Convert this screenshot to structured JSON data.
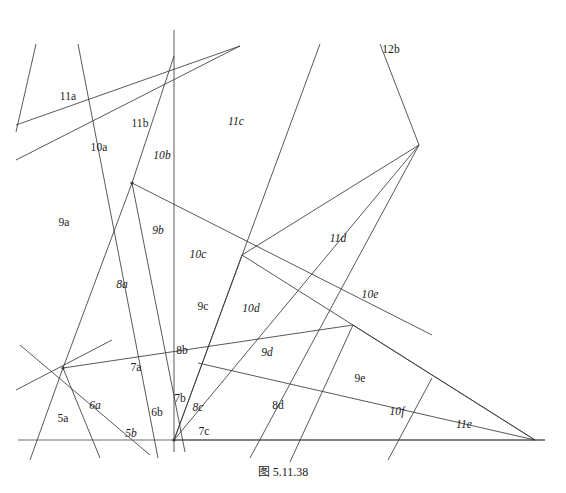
{
  "figure": {
    "caption": "图 5.11.38",
    "width": 566,
    "height": 493,
    "background_color": "#ffffff",
    "line_color": "#3a3a3a",
    "baseline_color": "#6e6e6e",
    "text_color": "#1a1a1a"
  },
  "chart_data": {
    "type": "diagram",
    "title": "图 5.11.38",
    "xlim": [
      0,
      566
    ],
    "ylim": [
      0,
      493
    ],
    "grid": false,
    "legend": null,
    "lines": [
      {
        "id": "L01",
        "x1": 18,
        "y1": 440,
        "x2": 545,
        "y2": 440,
        "role": "baseline"
      },
      {
        "id": "L02",
        "x1": 36,
        "y1": 44,
        "x2": 16,
        "y2": 132,
        "role": "stub"
      },
      {
        "id": "L03",
        "x1": 78,
        "y1": 44,
        "x2": 158,
        "y2": 458,
        "role": "line"
      },
      {
        "id": "L04",
        "x1": 174,
        "y1": 30,
        "x2": 174,
        "y2": 452,
        "role": "vertical"
      },
      {
        "id": "L05",
        "x1": 16,
        "y1": 125,
        "x2": 240,
        "y2": 46,
        "role": "line"
      },
      {
        "id": "L06",
        "x1": 16,
        "y1": 160,
        "x2": 240,
        "y2": 46,
        "role": "line"
      },
      {
        "id": "L07",
        "x1": 132,
        "y1": 183,
        "x2": 174,
        "y2": 56,
        "role": "line"
      },
      {
        "id": "L08",
        "x1": 132,
        "y1": 183,
        "x2": 63,
        "y2": 368,
        "role": "line"
      },
      {
        "id": "L09",
        "x1": 132,
        "y1": 183,
        "x2": 185,
        "y2": 452,
        "role": "line"
      },
      {
        "id": "L10",
        "x1": 132,
        "y1": 183,
        "x2": 432,
        "y2": 335,
        "role": "line"
      },
      {
        "id": "L11",
        "x1": 63,
        "y1": 368,
        "x2": 353,
        "y2": 325,
        "role": "line"
      },
      {
        "id": "L12",
        "x1": 63,
        "y1": 368,
        "x2": 30,
        "y2": 460,
        "role": "line"
      },
      {
        "id": "L13",
        "x1": 63,
        "y1": 368,
        "x2": 100,
        "y2": 458,
        "role": "line"
      },
      {
        "id": "L14",
        "x1": 20,
        "y1": 345,
        "x2": 150,
        "y2": 455,
        "role": "line"
      },
      {
        "id": "L15",
        "x1": 16,
        "y1": 390,
        "x2": 112,
        "y2": 340,
        "role": "line"
      },
      {
        "id": "L16",
        "x1": 174,
        "y1": 440,
        "x2": 320,
        "y2": 44,
        "role": "line"
      },
      {
        "id": "L17",
        "x1": 174,
        "y1": 440,
        "x2": 419,
        "y2": 145,
        "role": "line"
      },
      {
        "id": "L18",
        "x1": 174,
        "y1": 440,
        "x2": 545,
        "y2": 440,
        "role": "line"
      },
      {
        "id": "L19",
        "x1": 242,
        "y1": 255,
        "x2": 419,
        "y2": 145,
        "role": "line"
      },
      {
        "id": "L20",
        "x1": 242,
        "y1": 255,
        "x2": 174,
        "y2": 440,
        "role": "line"
      },
      {
        "id": "L21",
        "x1": 242,
        "y1": 255,
        "x2": 535,
        "y2": 440,
        "role": "line"
      },
      {
        "id": "L22",
        "x1": 419,
        "y1": 145,
        "x2": 380,
        "y2": 44,
        "role": "line"
      },
      {
        "id": "L23",
        "x1": 419,
        "y1": 145,
        "x2": 250,
        "y2": 458,
        "role": "line"
      },
      {
        "id": "L24",
        "x1": 353,
        "y1": 325,
        "x2": 535,
        "y2": 440,
        "role": "line"
      },
      {
        "id": "L25",
        "x1": 353,
        "y1": 325,
        "x2": 290,
        "y2": 462,
        "role": "line"
      },
      {
        "id": "L26",
        "x1": 432,
        "y1": 378,
        "x2": 388,
        "y2": 460,
        "role": "line"
      },
      {
        "id": "L27",
        "x1": 198,
        "y1": 363,
        "x2": 535,
        "y2": 440,
        "role": "line"
      }
    ],
    "vertices": [
      {
        "x": 132,
        "y": 183,
        "degree": 6
      },
      {
        "x": 63,
        "y": 368,
        "degree": 6
      },
      {
        "x": 174,
        "y": 440,
        "degree": 8
      },
      {
        "x": 242,
        "y": 255,
        "degree": 4
      },
      {
        "x": 419,
        "y": 145,
        "degree": 3
      },
      {
        "x": 353,
        "y": 325,
        "degree": 4
      },
      {
        "x": 198,
        "y": 363,
        "degree": 4
      },
      {
        "x": 535,
        "y": 440,
        "degree": 3
      }
    ],
    "labels": [
      {
        "text": "11a",
        "x": 68,
        "y": 97,
        "italic": false
      },
      {
        "text": "11b",
        "x": 140,
        "y": 124,
        "italic": false
      },
      {
        "text": "11c",
        "x": 236,
        "y": 122,
        "italic": true
      },
      {
        "text": "12b",
        "x": 391,
        "y": 50,
        "italic": false
      },
      {
        "text": "10a",
        "x": 99,
        "y": 148,
        "italic": false
      },
      {
        "text": "10b",
        "x": 162,
        "y": 156,
        "italic": true
      },
      {
        "text": "9a",
        "x": 64,
        "y": 223,
        "italic": false
      },
      {
        "text": "9b",
        "x": 158,
        "y": 231,
        "italic": true
      },
      {
        "text": "10c",
        "x": 198,
        "y": 255,
        "italic": true
      },
      {
        "text": "11d",
        "x": 338,
        "y": 239,
        "italic": true
      },
      {
        "text": "8a",
        "x": 122,
        "y": 285,
        "italic": true
      },
      {
        "text": "9c",
        "x": 203,
        "y": 307,
        "italic": false
      },
      {
        "text": "10d",
        "x": 251,
        "y": 309,
        "italic": true
      },
      {
        "text": "10e",
        "x": 370,
        "y": 295,
        "italic": true
      },
      {
        "text": "8b",
        "x": 182,
        "y": 351,
        "italic": false
      },
      {
        "text": "7a",
        "x": 136,
        "y": 368,
        "italic": false
      },
      {
        "text": "9d",
        "x": 267,
        "y": 353,
        "italic": true
      },
      {
        "text": "9e",
        "x": 360,
        "y": 379,
        "italic": false
      },
      {
        "text": "5a",
        "x": 63,
        "y": 419,
        "italic": false
      },
      {
        "text": "6a",
        "x": 95,
        "y": 406,
        "italic": true
      },
      {
        "text": "6b",
        "x": 157,
        "y": 413,
        "italic": false
      },
      {
        "text": "7b",
        "x": 180,
        "y": 399,
        "italic": false
      },
      {
        "text": "8c",
        "x": 198,
        "y": 408,
        "italic": true
      },
      {
        "text": "8d",
        "x": 278,
        "y": 406,
        "italic": false
      },
      {
        "text": "10f",
        "x": 397,
        "y": 412,
        "italic": true
      },
      {
        "text": "11e",
        "x": 464,
        "y": 425,
        "italic": true
      },
      {
        "text": "5b",
        "x": 131,
        "y": 434,
        "italic": true
      },
      {
        "text": "7c",
        "x": 204,
        "y": 432,
        "italic": false
      }
    ]
  }
}
